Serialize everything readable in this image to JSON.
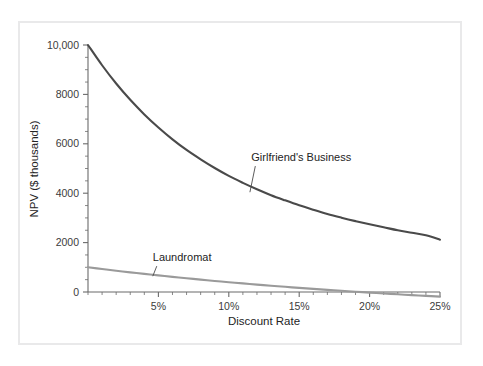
{
  "figure": {
    "name": "npv-vs-discount-rate-chart",
    "frame_border_color": "#e9e9ea",
    "background_color": "#ffffff"
  },
  "chart_data": {
    "type": "line",
    "title": "",
    "subtitle": "",
    "xlabel": "Discount Rate",
    "ylabel": "NPV ($ thousands)",
    "xlim": [
      0,
      25
    ],
    "ylim": [
      0,
      10000
    ],
    "grid": false,
    "legend_position": "inline-annotations",
    "x_tick_labels": [
      "5%",
      "10%",
      "15%",
      "20%",
      "25%"
    ],
    "x_tick_values": [
      5,
      10,
      15,
      20,
      25
    ],
    "x_minor_tick_interval": 1,
    "y_tick_labels": [
      "0",
      "2000",
      "4000",
      "6000",
      "8000",
      "10,000"
    ],
    "y_tick_values": [
      0,
      2000,
      4000,
      6000,
      8000,
      10000
    ],
    "y_minor_tick_interval": 500,
    "x": [
      0,
      1,
      2,
      3,
      4,
      5,
      6,
      7,
      8,
      9,
      10,
      11,
      12,
      13,
      14,
      15,
      16,
      17,
      18,
      19,
      20,
      21,
      22,
      23,
      24,
      25
    ],
    "series": [
      {
        "name": "Girlfriend's Business",
        "color": "#4a4a4a",
        "width": 2.1,
        "values": [
          10000,
          9180,
          8440,
          7780,
          7190,
          6660,
          6180,
          5750,
          5370,
          5020,
          4700,
          4420,
          4160,
          3920,
          3710,
          3510,
          3330,
          3160,
          3010,
          2870,
          2740,
          2620,
          2500,
          2400,
          2300,
          2120
        ],
        "label_text": "Girlfriend's Business",
        "label_x_pct": 11.6,
        "label_y_value": 5300,
        "leader_to_x_pct": 11.5,
        "leader_to_y_value": 4040
      },
      {
        "name": "Laundromat",
        "color": "#9a9a9a",
        "width": 2.1,
        "values": [
          1000,
          930,
          862,
          796,
          733,
          672,
          613,
          556,
          501,
          448,
          397,
          348,
          300,
          254,
          210,
          167,
          126,
          86,
          48,
          11,
          -25,
          -60,
          -93,
          -126,
          -157,
          -188
        ],
        "label_text": "Laundromat",
        "label_x_pct": 4.6,
        "label_y_value": 1250,
        "leader_to_x_pct": 4.6,
        "leader_to_y_value": 640
      }
    ],
    "annotations": [
      {
        "text": "Girlfriend's Business",
        "series": "Girlfriend's Business"
      },
      {
        "text": "Laundromat",
        "series": "Laundromat"
      }
    ]
  }
}
